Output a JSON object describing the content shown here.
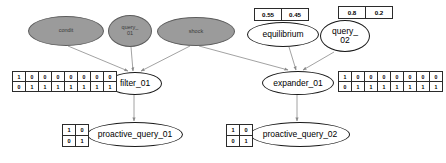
{
  "diagram": {
    "type": "bayesian-network",
    "nodes": [
      {
        "id": "condit",
        "label": "condit",
        "style": "evidence",
        "x": 28,
        "y": 16,
        "w": 76,
        "h": 30,
        "font": 5.5
      },
      {
        "id": "query_01",
        "label": "query_\n01",
        "style": "evidence",
        "x": 108,
        "y": 15,
        "w": 44,
        "h": 32,
        "font": 5.5
      },
      {
        "id": "shock",
        "label": "shock",
        "style": "evidence",
        "x": 157,
        "y": 17,
        "w": 78,
        "h": 29,
        "font": 5.5
      },
      {
        "id": "equilibrium",
        "label": "equilibrium",
        "style": "plain",
        "x": 247,
        "y": 22,
        "w": 72,
        "h": 25,
        "font": 8.5
      },
      {
        "id": "query_02",
        "label": "query_\n02",
        "style": "plain",
        "x": 320,
        "y": 20,
        "w": 50,
        "h": 32,
        "font": 8.5
      },
      {
        "id": "filter_01",
        "label": "filter_01",
        "style": "plain",
        "x": 108,
        "y": 72,
        "w": 54,
        "h": 23,
        "font": 8.5
      },
      {
        "id": "expander_01",
        "label": "expander_01",
        "style": "plain",
        "x": 262,
        "y": 71,
        "w": 72,
        "h": 24,
        "font": 8.5
      },
      {
        "id": "proactive_query_01",
        "label": "proactive_query_01",
        "style": "plain",
        "x": 87,
        "y": 122,
        "w": 96,
        "h": 25,
        "font": 8.5
      },
      {
        "id": "proactive_query_02",
        "label": "proactive_query_02",
        "style": "plain",
        "x": 250,
        "y": 122,
        "w": 100,
        "h": 25,
        "font": 8.5
      }
    ],
    "edges": [
      {
        "from": "condit",
        "to": "filter_01",
        "x1": 68,
        "y1": 46,
        "x2": 128,
        "y2": 71
      },
      {
        "from": "query_01",
        "to": "filter_01",
        "x1": 131,
        "y1": 47,
        "x2": 133,
        "y2": 71
      },
      {
        "from": "shock",
        "to": "filter_01",
        "x1": 190,
        "y1": 46,
        "x2": 141,
        "y2": 71
      },
      {
        "from": "shock",
        "to": "expander_01",
        "x1": 199,
        "y1": 46,
        "x2": 288,
        "y2": 70
      },
      {
        "from": "equilibrium",
        "to": "expander_01",
        "x1": 289,
        "y1": 47,
        "x2": 296,
        "y2": 70
      },
      {
        "from": "query_02",
        "to": "expander_01",
        "x1": 334,
        "y1": 52,
        "x2": 303,
        "y2": 70
      },
      {
        "from": "filter_01",
        "to": "proactive_query_01",
        "x1": 134,
        "y1": 95,
        "x2": 134,
        "y2": 121
      },
      {
        "from": "expander_01",
        "to": "proactive_query_02",
        "x1": 297,
        "y1": 95,
        "x2": 297,
        "y2": 121
      }
    ],
    "tables": [
      {
        "id": "cpt-equilibrium",
        "for": "equilibrium",
        "kind": "prob",
        "x": 254,
        "y": 8,
        "rows": [
          [
            "0.55",
            "0.45"
          ]
        ]
      },
      {
        "id": "cpt-query-02",
        "for": "query_02",
        "kind": "prob",
        "x": 338,
        "y": 6,
        "rows": [
          [
            "0.8",
            "0.2"
          ]
        ]
      },
      {
        "id": "cpt-filter-01",
        "for": "filter_01",
        "kind": "bits",
        "x": 12,
        "y": 71,
        "rows": [
          [
            "1",
            "0",
            "0",
            "0",
            "0",
            "0",
            "0",
            "0"
          ],
          [
            "0",
            "1",
            "1",
            "1",
            "1",
            "1",
            "1",
            "1"
          ]
        ]
      },
      {
        "id": "cpt-expander-01",
        "for": "expander_01",
        "kind": "bits",
        "x": 338,
        "y": 71,
        "rows": [
          [
            "1",
            "0",
            "0",
            "0",
            "0",
            "0",
            "0",
            "0"
          ],
          [
            "0",
            "1",
            "1",
            "1",
            "1",
            "1",
            "1",
            "1"
          ]
        ]
      },
      {
        "id": "cpt-proactive-query-01",
        "for": "proactive_query_01",
        "kind": "bits2",
        "x": 62,
        "y": 124,
        "rows": [
          [
            "1",
            "0"
          ],
          [
            "0",
            "1"
          ]
        ]
      },
      {
        "id": "cpt-proactive-query-02",
        "for": "proactive_query_02",
        "kind": "bits2",
        "x": 226,
        "y": 124,
        "rows": [
          [
            "1",
            "0"
          ],
          [
            "0",
            "1"
          ]
        ]
      }
    ],
    "colors": {
      "evidence_fill": "#9b9b9b",
      "evidence_stroke": "#5d5d5d",
      "node_stroke": "#1a1a1a",
      "edge_stroke": "#8a8a8a",
      "table_stroke": "#2b2b2b",
      "background": "#ffffff"
    }
  }
}
